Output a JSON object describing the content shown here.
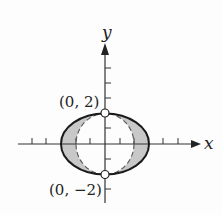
{
  "figure": {
    "type": "region between ellipse and circle",
    "axes": {
      "x_label": "x",
      "y_label": "y",
      "origin_px": [
        105,
        144
      ],
      "unit_px": 14.7,
      "x_ticks": [
        -6,
        -5,
        -4,
        -3,
        -2,
        -1,
        1,
        2,
        3,
        4,
        5
      ],
      "y_ticks": [
        -3,
        -2,
        -1,
        1,
        2,
        3,
        4,
        5
      ]
    },
    "curves": [
      {
        "name": "ellipse",
        "style": "solid",
        "a": 3,
        "b": 2,
        "color": "#1a1a1a"
      },
      {
        "name": "circle",
        "style": "dashed",
        "r": 2,
        "color": "#555555"
      }
    ],
    "shaded_region": {
      "description": "between ellipse and circle",
      "color": "#c8c8c8"
    },
    "points": [
      {
        "label": "(0, 2)",
        "x": 0,
        "y": 2,
        "marker": "open-circle"
      },
      {
        "label": "(0, −2)",
        "x": 0,
        "y": -2,
        "marker": "open-circle"
      }
    ]
  }
}
